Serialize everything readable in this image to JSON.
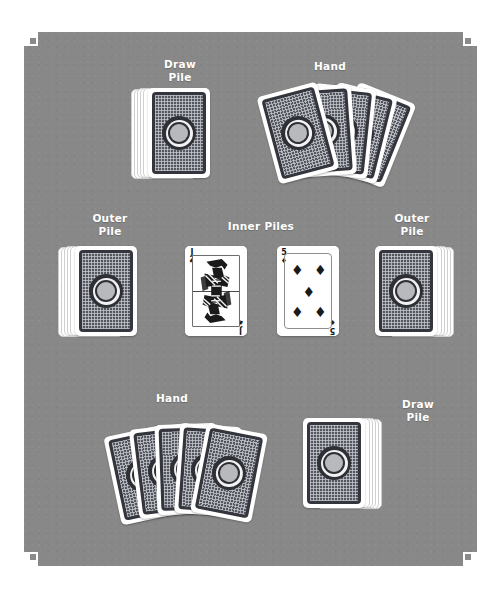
{
  "scene": {
    "title": "Card Game Table Layout",
    "background_color": "#ffffff",
    "table_color": "#888888",
    "label_color": "#ffffff",
    "card_back_color": "#3e3f46",
    "card_back_weave_color": "#55575f",
    "card_face_color": "#ffffff"
  },
  "labels": {
    "draw_pile_top": "Draw\nPile",
    "hand_top": "Hand",
    "outer_pile_left": "Outer\nPile",
    "inner_piles": "Inner Piles",
    "outer_pile_right": "Outer\nPile",
    "hand_bottom": "Hand",
    "draw_pile_bottom": "Draw\nPile"
  },
  "zones": [
    {
      "name": "draw-pile-top",
      "label": "Draw\nPile",
      "kind": "stack",
      "card_count": 6,
      "face": "back",
      "offset_direction": "left"
    },
    {
      "name": "hand-top",
      "label": "Hand",
      "kind": "fan",
      "card_count": 5,
      "face": "back",
      "fan_direction": "clockwise"
    },
    {
      "name": "outer-pile-left",
      "label": "Outer\nPile",
      "kind": "stack",
      "card_count": 6,
      "face": "back",
      "offset_direction": "left"
    },
    {
      "name": "inner-pile-left",
      "label": "Inner Piles",
      "kind": "single",
      "card_count": 1,
      "face": "up"
    },
    {
      "name": "inner-pile-right",
      "label": "Inner Piles",
      "kind": "single",
      "card_count": 1,
      "face": "up"
    },
    {
      "name": "outer-pile-right",
      "label": "Outer\nPile",
      "kind": "stack",
      "card_count": 6,
      "face": "back",
      "offset_direction": "right"
    },
    {
      "name": "hand-bottom",
      "label": "Hand",
      "kind": "fan",
      "card_count": 5,
      "face": "back",
      "fan_direction": "clockwise"
    },
    {
      "name": "draw-pile-bottom",
      "label": "Draw\nPile",
      "kind": "stack",
      "card_count": 6,
      "face": "back",
      "offset_direction": "right"
    }
  ],
  "inner_cards": [
    {
      "position": "left",
      "rank": "J",
      "suit": "spade",
      "suit_glyph": "♠",
      "color": "#1a1a1a",
      "type": "court",
      "name": "jack-of-spades"
    },
    {
      "position": "right",
      "rank": "5",
      "suit": "diamond",
      "suit_glyph": "♦",
      "color": "#1a1a1a",
      "type": "numeric",
      "name": "five-of-diamonds",
      "pip_count": 5
    }
  ],
  "card_back": {
    "ring_outer_color": "#2f3036",
    "ring_white_color": "#f2f2f2",
    "ring_inner_color": "#2f3036",
    "hub_color": "#b7b9bd"
  },
  "frame": {
    "corner_style": "notched-square",
    "corner_count": 4
  }
}
